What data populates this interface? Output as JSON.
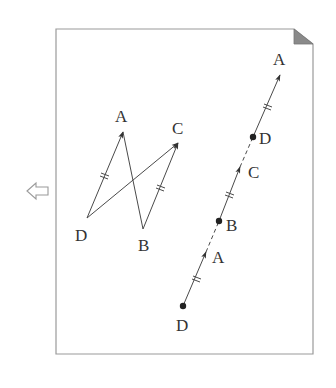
{
  "page": {
    "border_color": "#9a9a9a",
    "fold_color": "#8a8a8a",
    "back_arrow_icon": "left-outline-arrow"
  },
  "left_figure": {
    "points": {
      "A": {
        "label": "A",
        "x": 123,
        "y": 132
      },
      "C": {
        "label": "C",
        "x": 178,
        "y": 143
      },
      "D": {
        "label": "D",
        "x": 87,
        "y": 218
      },
      "B": {
        "label": "B",
        "x": 143,
        "y": 229
      }
    },
    "segments": [
      {
        "from": "D",
        "to": "A",
        "arrow": true,
        "ticks": 2
      },
      {
        "from": "B",
        "to": "C",
        "arrow": true,
        "ticks": 2
      },
      {
        "from": "D",
        "to": "C",
        "arrow": true,
        "ticks": 0
      },
      {
        "from": "A",
        "to": "B",
        "arrow": false,
        "ticks": 0
      }
    ]
  },
  "right_figure": {
    "labels": {
      "A_top": "A",
      "D_mid": "D",
      "C": "C",
      "B": "B",
      "A_low": "A",
      "D_bottom": "D"
    },
    "points": [
      {
        "name": "D",
        "x": 183,
        "y": 306,
        "dot": true
      },
      {
        "name": "A",
        "x": 206,
        "y": 252,
        "arrow": true
      },
      {
        "name": "B",
        "x": 219,
        "y": 221,
        "dot": true
      },
      {
        "name": "C",
        "x": 240,
        "y": 167,
        "arrow": true
      },
      {
        "name": "D",
        "x": 253,
        "y": 137,
        "dot": true
      },
      {
        "name": "A",
        "x": 280,
        "y": 75,
        "arrow": true
      }
    ]
  }
}
